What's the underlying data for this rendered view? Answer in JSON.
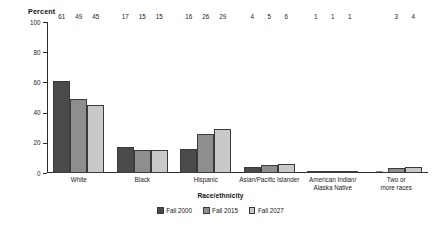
{
  "chart_data": {
    "type": "bar",
    "title": "",
    "xlabel": "Race/ethnicity",
    "ylabel": "Percent",
    "ylim": [
      0,
      100
    ],
    "yticks": [
      0,
      20,
      40,
      60,
      80,
      100
    ],
    "ytick_labels": [
      "0",
      "20",
      "40",
      "60",
      "80",
      "100"
    ],
    "grid": false,
    "legend_position": "bottom",
    "categories": [
      "White",
      "Black",
      "Hispanic",
      "Asian/Pacific Islander",
      "American Indian/ Alaska Native",
      "Two or more races"
    ],
    "category_lines": [
      [
        "White"
      ],
      [
        "Black"
      ],
      [
        "Hispanic"
      ],
      [
        "Asian/Pacific Islander"
      ],
      [
        "American Indian/",
        "Alaska Native"
      ],
      [
        "Two or",
        "more races"
      ]
    ],
    "series": [
      {
        "name": "Fall 2000",
        "color": "#4a4a4a",
        "values": [
          61,
          17,
          16,
          4,
          1,
          null
        ],
        "labels": [
          "61",
          "17",
          "16",
          "4",
          "1",
          "—"
        ]
      },
      {
        "name": "Fall 2015",
        "color": "#8e8e8e",
        "values": [
          49,
          15,
          26,
          5,
          1,
          3
        ],
        "labels": [
          "49",
          "15",
          "26",
          "5",
          "1",
          "3"
        ]
      },
      {
        "name": "Fall 2027",
        "color": "#c9c9c9",
        "values": [
          45,
          15,
          29,
          6,
          1,
          4
        ],
        "labels": [
          "45",
          "15",
          "29",
          "6",
          "1",
          "4"
        ]
      }
    ]
  },
  "legend": {
    "items": [
      {
        "label": "Fall 2000"
      },
      {
        "label": "Fall 2015"
      },
      {
        "label": "Fall 2027"
      }
    ]
  },
  "axis": {
    "y_title": "Percent",
    "x_title": "Race/ethnicity"
  }
}
